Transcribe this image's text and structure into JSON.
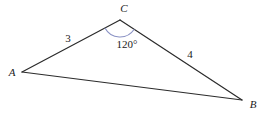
{
  "figure": {
    "background_color": "#ffffff",
    "stroke_color": "#2b2b2b",
    "arc_color": "#8a92c4",
    "width": 265,
    "height": 120
  },
  "chart_data": {
    "type": "diagram",
    "subtype": "triangle",
    "title": "",
    "vertices": [
      {
        "name": "A",
        "label": "A",
        "x": 22,
        "y": 72,
        "label_x": 12,
        "label_y": 73
      },
      {
        "name": "B",
        "label": "B",
        "x": 242,
        "y": 100,
        "label_x": 253,
        "label_y": 105
      },
      {
        "name": "C",
        "label": "C",
        "x": 120,
        "y": 20,
        "label_x": 124,
        "label_y": 9
      }
    ],
    "edges": [
      {
        "from": "A",
        "to": "C",
        "length_label": "3",
        "label_x": 68,
        "label_y": 39
      },
      {
        "from": "C",
        "to": "B",
        "length_label": "4",
        "label_x": 190,
        "label_y": 55
      },
      {
        "from": "A",
        "to": "B",
        "length_label": "",
        "label_x": 0,
        "label_y": 0
      }
    ],
    "angles": [
      {
        "at_vertex": "C",
        "value": 120,
        "unit": "degrees",
        "label": "120°",
        "label_x": 127,
        "label_y": 45,
        "arc_color": "#8a92c4",
        "arc_radius": 17
      }
    ]
  },
  "labels": {
    "vertex_a": "A",
    "vertex_b": "B",
    "vertex_c": "C",
    "side_ac": "3",
    "side_cb": "4",
    "angle_c": "120°"
  }
}
